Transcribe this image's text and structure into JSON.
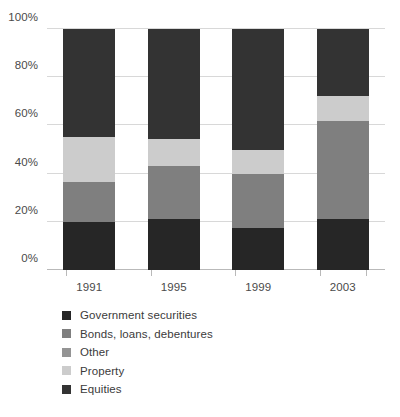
{
  "chart_data": {
    "type": "bar",
    "title": "",
    "subtitle": "",
    "xlabel": "",
    "ylabel": "",
    "stacked": true,
    "stack_total": 100,
    "grid": true,
    "legend_position": "bottom-left",
    "categories": [
      "1991",
      "1995",
      "1999",
      "2003"
    ],
    "ylim": [
      0,
      100
    ],
    "yticks": [
      0,
      20,
      40,
      60,
      80,
      100
    ],
    "ytick_labels": [
      "0%",
      "20%",
      "40%",
      "60%",
      "80%",
      "100%"
    ],
    "series": [
      {
        "name": "Government securities",
        "color": "#262626",
        "values": [
          20,
          21,
          17.5,
          21
        ]
      },
      {
        "name": "Bonds, loans, debentures",
        "color": "#7f7f7f",
        "values": [
          16.5,
          22,
          22.5,
          41
        ]
      },
      {
        "name": "Other",
        "color": "#949494",
        "values": [
          0,
          0,
          0,
          0
        ]
      },
      {
        "name": "Property",
        "color": "#cccccc",
        "values": [
          18.5,
          11.5,
          10,
          10
        ]
      },
      {
        "name": "Equities",
        "color": "#333333",
        "values": [
          45,
          45.5,
          50,
          28
        ]
      }
    ]
  },
  "legend": {
    "items": [
      {
        "label": "Government securities",
        "color": "#262626"
      },
      {
        "label": "Bonds, loans, debentures",
        "color": "#7f7f7f"
      },
      {
        "label": "Other",
        "color": "#949494"
      },
      {
        "label": "Property",
        "color": "#cccccc"
      },
      {
        "label": "Equities",
        "color": "#333333"
      }
    ]
  },
  "colors": {
    "gridline": "#d8d8d8",
    "axis": "#b9b9b9",
    "text": "#3b3b3b",
    "background": "#ffffff"
  }
}
